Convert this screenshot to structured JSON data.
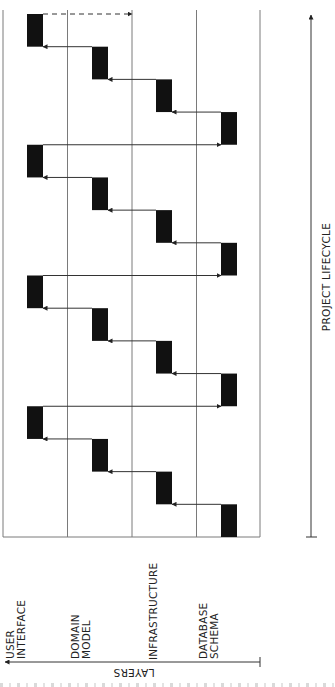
{
  "diagram": {
    "type": "iterative-layer-development",
    "orientation": "rotated-90-ccw",
    "axes": {
      "lifecycle": {
        "label": "PROJECT LIFECYCLE",
        "direction": "up"
      },
      "layers": {
        "label": "LAYERS",
        "direction": "left"
      }
    },
    "layers": [
      {
        "id": "ui",
        "label_line1": "USER",
        "label_line2": "INTERFACE"
      },
      {
        "id": "dm",
        "label_line1": "DOMAIN",
        "label_line2": "MODEL"
      },
      {
        "id": "inf",
        "label_line1": "INFRASTRUCTURE",
        "label_line2": ""
      },
      {
        "id": "db",
        "label_line1": "DATABASE",
        "label_line2": "SCHEMA"
      }
    ],
    "iterations": 4,
    "blocks_per_iteration": 4,
    "final_continuation": "dashed-arrow",
    "colors": {
      "grid": "#7a7a7a",
      "block": "#111111",
      "arrow": "#333333",
      "text": "#222222"
    }
  }
}
